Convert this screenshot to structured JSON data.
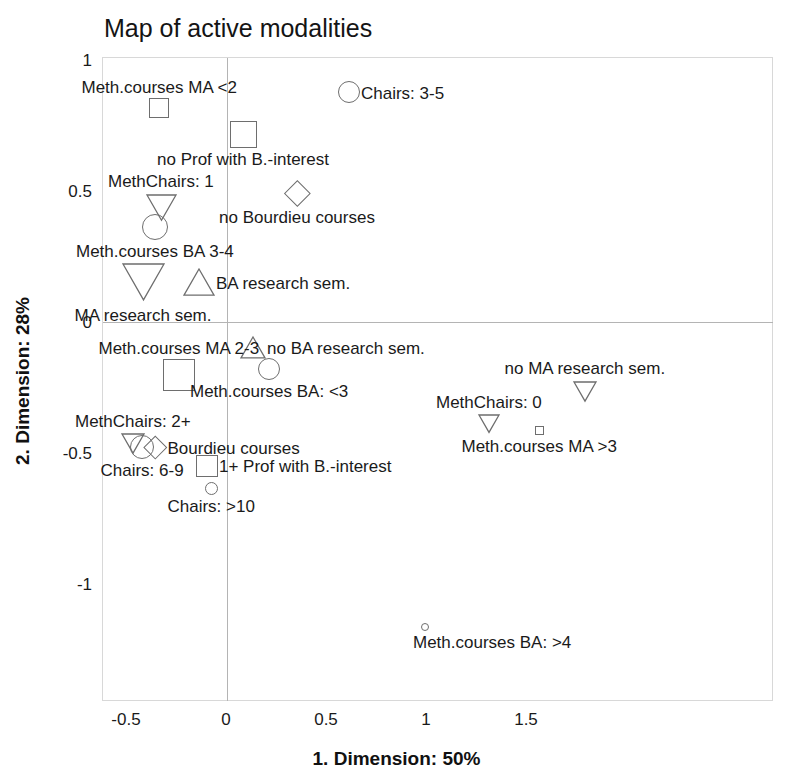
{
  "chart_data": {
    "type": "scatter",
    "title": "Map of active modalities",
    "xlabel": "1. Dimension: 50%",
    "ylabel": "2. Dimension: 28%",
    "xlim": [
      -0.74,
      1.97
    ],
    "ylim": [
      -1.26,
      1.24
    ],
    "xticks": [
      "-0.5",
      "0",
      "0.5",
      "1",
      "1.5"
    ],
    "xtick_values": [
      -0.5,
      0,
      0.5,
      1,
      1.5
    ],
    "yticks": [
      "1",
      "0.5",
      "0",
      "-0.5",
      "-1"
    ],
    "ytick_values": [
      1,
      0.5,
      0,
      -0.5,
      -1
    ],
    "grid": false,
    "legend": "none",
    "zero_lines": true,
    "points": [
      {
        "label": "Meth.courses MA <2",
        "x": -0.34,
        "y": 0.82,
        "shape": "square",
        "size": 20,
        "label_pos": "above"
      },
      {
        "label": "Chairs: 3-5",
        "x": 0.61,
        "y": 0.88,
        "shape": "circle",
        "size": 22,
        "label_pos": "right"
      },
      {
        "label": "no Prof with B.-interest",
        "x": 0.08,
        "y": 0.72,
        "shape": "square",
        "size": 27,
        "label_pos": "below"
      },
      {
        "label": "MethChairs: 1",
        "x": -0.33,
        "y": 0.44,
        "shape": "triangle-down",
        "size": 31,
        "label_pos": "above"
      },
      {
        "label": "no Bourdieu courses",
        "x": 0.35,
        "y": 0.495,
        "shape": "diamond",
        "size": 26,
        "label_pos": "below"
      },
      {
        "label": "Meth.courses BA 3-4",
        "x": -0.36,
        "y": 0.365,
        "shape": "circle",
        "size": 26,
        "label_pos": "below"
      },
      {
        "label": "MA research sem.",
        "x": -0.42,
        "y": 0.155,
        "shape": "triangle-down",
        "size": 43,
        "label_pos": "below"
      },
      {
        "label": "BA research sem.",
        "x": -0.14,
        "y": 0.155,
        "shape": "triangle-up",
        "size": 32,
        "label_pos": "right"
      },
      {
        "label": "no BA research sem.",
        "x": 0.13,
        "y": -0.095,
        "shape": "triangle-up",
        "size": 26,
        "label_pos": "right"
      },
      {
        "label": "Meth.courses MA 2-3",
        "x": -0.24,
        "y": -0.2,
        "shape": "square",
        "size": 32,
        "label_pos": "above"
      },
      {
        "label": "Meth.courses BA: <3",
        "x": 0.21,
        "y": -0.175,
        "shape": "circle",
        "size": 22,
        "label_pos": "below"
      },
      {
        "label": "no MA research sem.",
        "x": 1.79,
        "y": -0.26,
        "shape": "triangle-down",
        "size": 24,
        "label_pos": "above"
      },
      {
        "label": "MethChairs: 0",
        "x": 1.31,
        "y": -0.385,
        "shape": "triangle-down",
        "size": 22,
        "label_pos": "above"
      },
      {
        "label": "Meth.courses MA >3",
        "x": 1.56,
        "y": -0.41,
        "shape": "square",
        "size": 9,
        "label_pos": "below"
      },
      {
        "label": "MethChairs: 2+",
        "x": -0.47,
        "y": -0.46,
        "shape": "triangle-down",
        "size": 24,
        "label_pos": "above"
      },
      {
        "label": "Chairs: 6-9",
        "x": -0.425,
        "y": -0.475,
        "shape": "circle",
        "size": 24,
        "label_pos": "below"
      },
      {
        "label": "Bourdieu courses",
        "x": -0.36,
        "y": -0.475,
        "shape": "diamond",
        "size": 23,
        "label_pos": "right"
      },
      {
        "label": "1+ Prof with B.-interest",
        "x": -0.1,
        "y": -0.545,
        "shape": "square",
        "size": 22,
        "label_pos": "right"
      },
      {
        "label": "Chairs: >10",
        "x": -0.08,
        "y": -0.63,
        "shape": "circle",
        "size": 13,
        "label_pos": "below"
      },
      {
        "label": "Meth.courses BA: >4",
        "x": 0.99,
        "y": -1.16,
        "shape": "circle",
        "size": 8,
        "label_pos": "below-right"
      }
    ]
  },
  "axes": {
    "title": "Map of active modalities",
    "x_axis_label": "1. Dimension: 50%",
    "y_axis_label": "2. Dimension: 28%"
  },
  "colors": {
    "marker_stroke": "#6e6e6e",
    "frame": "#d8d8d8",
    "zero_line": "#b4b4b4",
    "text": "#1a1a1a",
    "background": "#ffffff"
  }
}
